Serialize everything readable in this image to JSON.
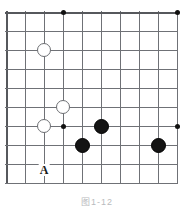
{
  "figure": {
    "kind": "go-board-diagram",
    "caption": "图1-12",
    "board": {
      "origin_x": 6,
      "origin_y": 12,
      "spacing": 19,
      "columns": 10,
      "rows": 10,
      "line_color": "#6f7176",
      "edge_color": "#56585c",
      "background": "#ffffff"
    },
    "star_points": [
      {
        "col": 3,
        "row": 0
      },
      {
        "col": 9,
        "row": 0
      },
      {
        "col": 3,
        "row": 6
      },
      {
        "col": 9,
        "row": 6
      }
    ],
    "stones": [
      {
        "color": "white",
        "col": 2,
        "row": 2
      },
      {
        "color": "white",
        "col": 3,
        "row": 5
      },
      {
        "color": "white",
        "col": 2,
        "row": 6
      },
      {
        "color": "black",
        "col": 5,
        "row": 6
      },
      {
        "color": "black",
        "col": 4,
        "row": 7
      },
      {
        "color": "black",
        "col": 8,
        "row": 7
      }
    ],
    "labels": [
      {
        "text": "A",
        "col": 2,
        "row": 8,
        "offset_y": 6
      }
    ],
    "colors": {
      "black_stone": "#141414",
      "white_stone_fill": "#ffffff",
      "white_stone_border": "#6d6f73",
      "star_point": "#111111",
      "label_text": "#1a1a1a",
      "caption_text": "#b9bbbe"
    }
  }
}
